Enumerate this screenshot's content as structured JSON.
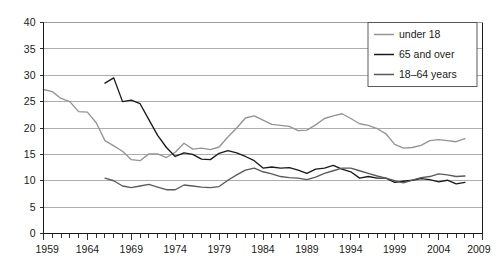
{
  "chart_data": {
    "type": "line",
    "title": "",
    "xlabel": "",
    "ylabel": "",
    "xlim": [
      1959,
      2009
    ],
    "ylim": [
      0,
      40
    ],
    "grid": true,
    "legend_position": "top-right",
    "y_ticks": [
      0,
      5,
      10,
      15,
      20,
      25,
      30,
      35,
      40
    ],
    "y_tick_labels": [
      "0",
      "5",
      "10",
      "15",
      "20",
      "25",
      "30",
      "35",
      "40"
    ],
    "x_ticks": [
      1959,
      1964,
      1969,
      1974,
      1979,
      1984,
      1989,
      1994,
      1999,
      2004,
      2009
    ],
    "x_tick_labels": [
      "1959",
      "1964",
      "1969",
      "1974",
      "1979",
      "1984",
      "1989",
      "1994",
      "1999",
      "2004",
      "2009"
    ],
    "x_minor_tick_step": 1,
    "series": [
      {
        "name": "under 18",
        "color": "#949494",
        "x": [
          1959,
          1960,
          1961,
          1962,
          1963,
          1964,
          1965,
          1966,
          1967,
          1968,
          1969,
          1970,
          1971,
          1972,
          1973,
          1974,
          1975,
          1976,
          1977,
          1978,
          1979,
          1980,
          1981,
          1982,
          1983,
          1984,
          1985,
          1986,
          1987,
          1988,
          1989,
          1990,
          1991,
          1992,
          1993,
          1994,
          1995,
          1996,
          1997,
          1998,
          1999,
          2000,
          2001,
          2002,
          2003,
          2004,
          2005,
          2006,
          2007
        ],
        "values": [
          27.3,
          26.9,
          25.6,
          25.0,
          23.1,
          23.0,
          21.0,
          17.6,
          16.6,
          15.6,
          14.0,
          13.8,
          15.1,
          15.1,
          14.4,
          15.4,
          17.1,
          16.0,
          16.2,
          15.9,
          16.4,
          18.3,
          20.0,
          21.9,
          22.3,
          21.5,
          20.7,
          20.5,
          20.3,
          19.5,
          19.6,
          20.6,
          21.8,
          22.3,
          22.7,
          21.8,
          20.8,
          20.5,
          19.9,
          18.9,
          16.9,
          16.2,
          16.3,
          16.7,
          17.6,
          17.8,
          17.6,
          17.4,
          18.0
        ]
      },
      {
        "name": "65 and over",
        "color": "#1a1a1a",
        "x": [
          1966,
          1967,
          1968,
          1969,
          1970,
          1971,
          1972,
          1973,
          1974,
          1975,
          1976,
          1977,
          1978,
          1979,
          1980,
          1981,
          1982,
          1983,
          1984,
          1985,
          1986,
          1987,
          1988,
          1989,
          1990,
          1991,
          1992,
          1993,
          1994,
          1995,
          1996,
          1997,
          1998,
          1999,
          2000,
          2001,
          2002,
          2003,
          2004,
          2005,
          2006,
          2007
        ],
        "values": [
          28.5,
          29.5,
          25.0,
          25.3,
          24.6,
          21.6,
          18.6,
          16.3,
          14.6,
          15.3,
          15.0,
          14.1,
          14.0,
          15.2,
          15.7,
          15.3,
          14.6,
          13.8,
          12.4,
          12.6,
          12.4,
          12.5,
          12.0,
          11.4,
          12.2,
          12.4,
          12.9,
          12.2,
          11.7,
          10.5,
          10.8,
          10.5,
          10.5,
          9.7,
          9.9,
          10.1,
          10.4,
          10.2,
          9.8,
          10.1,
          9.4,
          9.7
        ]
      },
      {
        "name": "18–64 years",
        "color": "#5a5a5a",
        "x": [
          1966,
          1967,
          1968,
          1969,
          1970,
          1971,
          1972,
          1973,
          1974,
          1975,
          1976,
          1977,
          1978,
          1979,
          1980,
          1981,
          1982,
          1983,
          1984,
          1985,
          1986,
          1987,
          1988,
          1989,
          1990,
          1991,
          1992,
          1993,
          1994,
          1995,
          1996,
          1997,
          1998,
          1999,
          2000,
          2001,
          2002,
          2003,
          2004,
          2005,
          2006,
          2007
        ],
        "values": [
          10.5,
          10.0,
          9.0,
          8.7,
          9.0,
          9.3,
          8.8,
          8.3,
          8.3,
          9.2,
          9.0,
          8.8,
          8.7,
          8.9,
          10.1,
          11.1,
          12.0,
          12.4,
          11.7,
          11.3,
          10.8,
          10.6,
          10.5,
          10.2,
          10.7,
          11.4,
          11.9,
          12.4,
          12.4,
          11.9,
          11.4,
          10.9,
          10.5,
          10.0,
          9.6,
          10.1,
          10.6,
          10.8,
          11.3,
          11.1,
          10.8,
          10.9
        ]
      }
    ],
    "legend_entries": [
      {
        "label": "under 18",
        "color": "#949494"
      },
      {
        "label": "65 and over",
        "color": "#1a1a1a"
      },
      {
        "label": "18–64 years",
        "color": "#5a5a5a"
      }
    ]
  }
}
